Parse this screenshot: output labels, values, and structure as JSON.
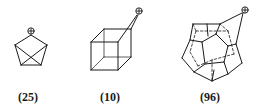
{
  "figure": {
    "structures": [
      {
        "id": "25",
        "label": "(25)",
        "description": "pentagonal cation with crossing bonds",
        "charge": "+"
      },
      {
        "id": "10",
        "label": "(10)",
        "description": "cubyl cation",
        "charge": "+"
      },
      {
        "id": "96",
        "label": "(96)",
        "description": "dodecahedryl cation",
        "charge": "+"
      }
    ],
    "colors": {
      "line": "#1a1a1a",
      "background": "#ffffff"
    }
  }
}
